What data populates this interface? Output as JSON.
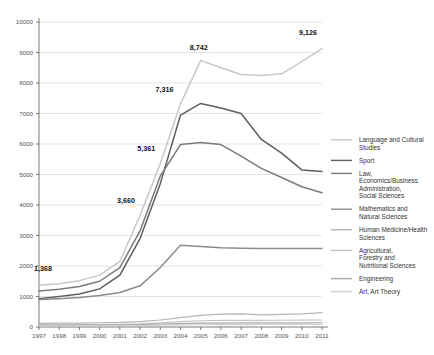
{
  "chart_data": {
    "type": "line",
    "title": "",
    "xlabel": "",
    "ylabel": "",
    "x": [
      1997,
      1998,
      1999,
      2000,
      2001,
      2002,
      2003,
      2004,
      2005,
      2006,
      2007,
      2008,
      2009,
      2010,
      2011
    ],
    "categories": [
      "1997",
      "1998",
      "1999",
      "2000",
      "2001",
      "2002",
      "2003",
      "2004",
      "2005",
      "2006",
      "2007",
      "2008",
      "2009",
      "2010",
      "2011"
    ],
    "ylim": [
      0,
      10000
    ],
    "yticks": [
      0,
      1000,
      2000,
      3000,
      4000,
      5000,
      6000,
      7000,
      8000,
      9000,
      10000
    ],
    "ytick_labels": [
      "0",
      "1000",
      "2000",
      "3000",
      "4000",
      "5000",
      "6000",
      "7000",
      "8000",
      "9000",
      "10000"
    ],
    "grid": true,
    "legend_position": "right",
    "series": [
      {
        "name": "Language and Cultural Studies",
        "color": "#c9c9c9",
        "width": 1.5,
        "values": [
          1368,
          1420,
          1520,
          1700,
          2150,
          3660,
          5361,
          7316,
          8742,
          8500,
          8280,
          8250,
          8300,
          8700,
          9126
        ]
      },
      {
        "name": "Sport",
        "color": "#5e5e5e",
        "width": 1.5,
        "values": [
          930,
          1000,
          1080,
          1250,
          1700,
          2900,
          4700,
          6950,
          7330,
          7180,
          7000,
          6150,
          5700,
          5150,
          5100
        ]
      },
      {
        "name": "Law, Economics/Business Administration, Social Sciences",
        "color": "#7b7b7b",
        "width": 1.5,
        "values": [
          1180,
          1240,
          1330,
          1500,
          1950,
          3150,
          4950,
          5980,
          6050,
          5980,
          5600,
          5200,
          4900,
          4600,
          4400
        ]
      },
      {
        "name": "Mathematics and Natural Sciences",
        "color": "#8c8c8c",
        "width": 1.5,
        "values": [
          900,
          930,
          970,
          1030,
          1130,
          1350,
          1950,
          2680,
          2640,
          2600,
          2580,
          2570,
          2570,
          2570,
          2570
        ]
      },
      {
        "name": "Human Medicine/Health Sciences",
        "color": "#b5b5b5",
        "width": 1.2,
        "values": [
          120,
          125,
          130,
          140,
          150,
          175,
          230,
          310,
          380,
          420,
          430,
          400,
          415,
          430,
          470
        ]
      },
      {
        "name": "Agricultural, Forestry and Nutritional Sciences",
        "color": "#c4c4c4",
        "width": 1.2,
        "values": [
          70,
          72,
          76,
          82,
          90,
          105,
          135,
          175,
          205,
          215,
          218,
          220,
          222,
          225,
          230
        ]
      },
      {
        "name": "Engineering",
        "color": "#a8a8a8",
        "width": 1.2,
        "values": [
          60,
          62,
          64,
          68,
          72,
          80,
          95,
          110,
          125,
          130,
          132,
          134,
          136,
          138,
          140
        ]
      },
      {
        "name": "Art, Art Theory",
        "color": "#d0d0d0",
        "width": 1.2,
        "values": [
          40,
          41,
          43,
          45,
          48,
          52,
          60,
          68,
          74,
          78,
          80,
          82,
          84,
          86,
          88
        ]
      }
    ],
    "annotations": [
      {
        "label": "1,368",
        "x": 1997,
        "y": 1368,
        "dx": 4,
        "dy": -14
      },
      {
        "label": "3,660",
        "x": 2002,
        "y": 3660,
        "dx": -14,
        "dy": -12
      },
      {
        "label": "5,361",
        "x": 2003,
        "y": 5361,
        "dx": -14,
        "dy": -12
      },
      {
        "label": "7,316",
        "x": 2004,
        "y": 7316,
        "dx": -16,
        "dy": -12
      },
      {
        "label": "8,742",
        "x": 2005,
        "y": 8742,
        "dx": -2,
        "dy": -10
      },
      {
        "label": "9,126",
        "x": 2011,
        "y": 9126,
        "dx": -14,
        "dy": -14
      }
    ]
  },
  "legend": {
    "items": [
      {
        "label": "Language and Cultural Studies"
      },
      {
        "label": "Sport"
      },
      {
        "label": "Law, Economics/Business Administration, Social Sciences"
      },
      {
        "label": "Mathematics and Natural Sciences"
      },
      {
        "label": "Human Medicine/Health Sciences"
      },
      {
        "label": "Agricultural, Forestry and Nutritional Sciences"
      },
      {
        "label": "Engineering"
      },
      {
        "label": "Art, Art Theory"
      }
    ]
  }
}
